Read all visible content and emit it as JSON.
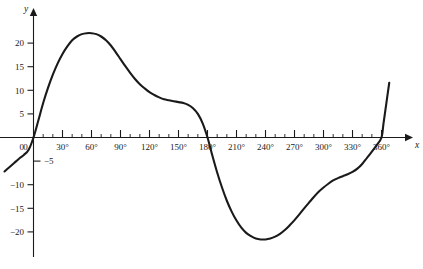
{
  "chart_data": {
    "type": "line",
    "title": "",
    "subtitle": "",
    "xlabel": "x",
    "ylabel": "y",
    "grid": false,
    "legend": null,
    "xlim": [
      -35,
      385
    ],
    "ylim": [
      -24,
      24
    ],
    "x_unit": "degrees",
    "x_major_step": 30,
    "x_minor_step": 10,
    "y_major_step": 5,
    "x_tick_labels": [
      "0",
      "30°",
      "60°",
      "90°",
      "120°",
      "150°",
      "180°",
      "210°",
      "240°",
      "270°",
      "300°",
      "330°",
      "360°"
    ],
    "x_tick_values": [
      0,
      30,
      60,
      90,
      120,
      150,
      180,
      210,
      240,
      270,
      300,
      330,
      360
    ],
    "y_tick_labels": [
      "20",
      "15",
      "10",
      "5",
      "0",
      "−5",
      "−10",
      "−15",
      "−20"
    ],
    "y_tick_values": [
      20,
      15,
      10,
      5,
      0,
      -5,
      -10,
      -15,
      -20
    ],
    "origin_label": "0",
    "series": [
      {
        "name": "curve",
        "color": "#1a1a1a",
        "x": [
          -30,
          -25,
          -20,
          -15,
          -10,
          -5,
          0,
          5,
          10,
          15,
          20,
          25,
          30,
          35,
          40,
          45,
          50,
          55,
          60,
          65,
          70,
          75,
          80,
          85,
          90,
          95,
          100,
          105,
          110,
          115,
          120,
          125,
          130,
          135,
          140,
          145,
          150,
          155,
          160,
          165,
          170,
          175,
          180,
          185,
          190,
          195,
          200,
          205,
          210,
          215,
          220,
          225,
          230,
          235,
          240,
          245,
          250,
          255,
          260,
          265,
          270,
          275,
          280,
          285,
          290,
          295,
          300,
          305,
          310,
          315,
          320,
          325,
          330,
          335,
          340,
          345,
          350,
          355,
          360,
          362,
          364,
          366,
          368
        ],
        "y": [
          -7.2,
          -6.3,
          -5.4,
          -4.5,
          -3.7,
          -2.6,
          0.0,
          3.6,
          7.3,
          10.5,
          13.3,
          15.7,
          17.7,
          19.3,
          20.6,
          21.4,
          21.9,
          22.1,
          22.1,
          21.9,
          21.4,
          20.6,
          19.5,
          18.1,
          16.6,
          15.1,
          13.7,
          12.4,
          11.3,
          10.4,
          9.6,
          9.0,
          8.5,
          8.1,
          7.9,
          7.7,
          7.5,
          7.3,
          6.9,
          6.2,
          5.0,
          3.0,
          0.0,
          -3.8,
          -7.4,
          -10.6,
          -13.4,
          -15.7,
          -17.6,
          -19.1,
          -20.2,
          -20.9,
          -21.4,
          -21.6,
          -21.6,
          -21.4,
          -21.0,
          -20.4,
          -19.6,
          -18.6,
          -17.5,
          -16.3,
          -15.0,
          -13.8,
          -12.6,
          -11.5,
          -10.6,
          -9.8,
          -9.1,
          -8.6,
          -8.2,
          -7.8,
          -7.3,
          -6.6,
          -5.6,
          -4.3,
          -3.0,
          -1.6,
          0.0,
          2.9,
          5.8,
          8.7,
          11.6
        ]
      }
    ],
    "annotations": {
      "maximum": {
        "x": 60,
        "y": 22.1
      },
      "minimum": {
        "x": 240,
        "y": -21.6
      },
      "zero_crossings": [
        0,
        180,
        360
      ]
    }
  },
  "axes": {
    "y_axis_name": "y",
    "x_axis_name": "x"
  }
}
